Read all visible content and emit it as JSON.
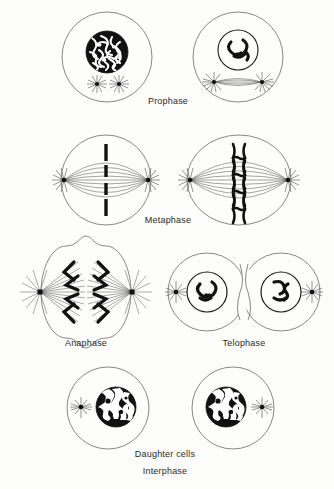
{
  "figure": {
    "background_color": "#fdfdfc",
    "ink_color": "#1a1a1a",
    "line_color": "#555555"
  },
  "labels": [
    {
      "id": "prophase",
      "text": "Prophase",
      "x": 168,
      "y": 102
    },
    {
      "id": "metaphase",
      "text": "Metaphase",
      "x": 168,
      "y": 221
    },
    {
      "id": "anaphase",
      "text": "Anaphase",
      "x": 86,
      "y": 344
    },
    {
      "id": "telophase",
      "text": "Telophase",
      "x": 244,
      "y": 344
    },
    {
      "id": "daughter-cells",
      "text": "Daughter cells",
      "x": 165,
      "y": 455
    },
    {
      "id": "interphase",
      "text": "Interphase",
      "x": 165,
      "y": 472
    }
  ],
  "stages": [
    {
      "id": "prophase",
      "label": "Prophase",
      "cells": [
        {
          "id": "prophase-early",
          "shape": "circle",
          "cx": 107,
          "cy": 57,
          "r": 45,
          "nucleus": {
            "cx": 107,
            "cy": 52,
            "r": 21,
            "appearance": "dense-tangled-chromatin"
          },
          "asters": [
            {
              "cx": 97,
              "cy": 84
            },
            {
              "cx": 119,
              "cy": 84
            }
          ],
          "spindle": false
        },
        {
          "id": "prophase-late",
          "shape": "circle",
          "cx": 238,
          "cy": 57,
          "r": 45,
          "nucleus": {
            "cx": 238,
            "cy": 50,
            "r": 20,
            "appearance": "condensed-chromosomes"
          },
          "asters": [
            {
              "cx": 214,
              "cy": 82
            },
            {
              "cx": 262,
              "cy": 82
            }
          ],
          "spindle": true
        }
      ]
    },
    {
      "id": "metaphase",
      "label": "Metaphase",
      "cells": [
        {
          "id": "metaphase-left",
          "shape": "circle",
          "cx": 106,
          "cy": 180,
          "r": 45,
          "chromosome_count": 4,
          "chromosome_style": "bar",
          "poles": [
            {
              "cx": 64,
              "cy": 180
            },
            {
              "cx": 148,
              "cy": 180
            }
          ]
        },
        {
          "id": "metaphase-right",
          "shape": "ellipse",
          "cx": 239,
          "cy": 180,
          "rx": 52,
          "ry": 45,
          "chromosome_count": 4,
          "chromosome_style": "x-shaped",
          "poles": [
            {
              "cx": 190,
              "cy": 180
            },
            {
              "cx": 288,
              "cy": 180
            }
          ]
        }
      ]
    },
    {
      "id": "anaphase",
      "label": "Anaphase",
      "cells": [
        {
          "id": "anaphase-cell",
          "shape": "dumbbell",
          "cx": 86,
          "cy": 292,
          "poles": [
            {
              "cx": 40,
              "cy": 292
            },
            {
              "cx": 132,
              "cy": 292
            }
          ],
          "chromosome_count_per_pole": 4,
          "chromosome_style": "v-shaped"
        }
      ]
    },
    {
      "id": "telophase",
      "label": "Telophase",
      "cells": [
        {
          "id": "telophase-cell",
          "shape": "dumbbell-pinched",
          "cx": 244,
          "cy": 292,
          "daughter_nuclei": [
            {
              "cx": 207,
              "cy": 292,
              "r": 20,
              "appearance": "reforming-chromosomes"
            },
            {
              "cx": 281,
              "cy": 292,
              "r": 20,
              "appearance": "reforming-chromosomes"
            }
          ],
          "asters": [
            {
              "cx": 176,
              "cy": 292
            },
            {
              "cx": 312,
              "cy": 292
            }
          ]
        }
      ]
    },
    {
      "id": "interphase",
      "label": "Interphase",
      "sublabel": "Daughter cells",
      "cells": [
        {
          "id": "daughter-cell-left",
          "shape": "circle",
          "cx": 108,
          "cy": 408,
          "r": 41,
          "nucleus": {
            "cx": 116,
            "cy": 407,
            "r": 20,
            "appearance": "mottled-chromatin"
          },
          "asters": [
            {
              "cx": 81,
              "cy": 407
            }
          ]
        },
        {
          "id": "daughter-cell-right",
          "shape": "circle",
          "cx": 233,
          "cy": 408,
          "r": 41,
          "nucleus": {
            "cx": 226,
            "cy": 407,
            "r": 20,
            "appearance": "mottled-chromatin"
          },
          "asters": [
            {
              "cx": 262,
              "cy": 407
            }
          ]
        }
      ]
    }
  ]
}
